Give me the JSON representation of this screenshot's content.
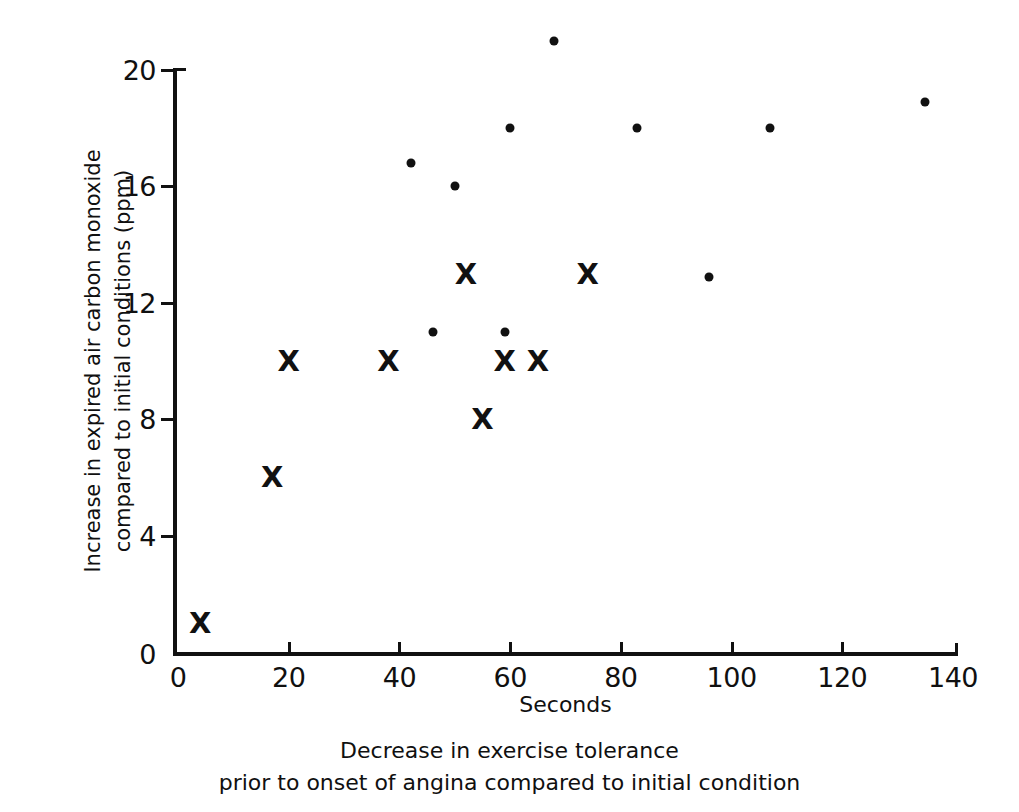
{
  "chart_data": {
    "type": "scatter",
    "title": "",
    "xlabel": "Seconds",
    "ylabel": "Increase in expired air carbon monoxide compared to initial conditions (ppm)",
    "ylabel_lines": [
      "Increase in expired air carbon monoxide",
      "compared to initial conditions (ppm)"
    ],
    "caption_lines": [
      "Decrease in exercise tolerance",
      "prior to onset of angina compared to initial condition"
    ],
    "xlim": [
      0,
      140
    ],
    "ylim": [
      0,
      20
    ],
    "xticks": [
      0,
      20,
      40,
      60,
      80,
      100,
      120,
      140
    ],
    "yticks": [
      0,
      4,
      8,
      12,
      16,
      20
    ],
    "xtick_labels": [
      "0",
      "20",
      "40",
      "60",
      "80",
      "100",
      "120",
      "140"
    ],
    "ytick_labels": [
      "0",
      "4",
      "8",
      "12",
      "16",
      "20"
    ],
    "grid": false,
    "legend": "none",
    "marker_color": "#111111",
    "series": [
      {
        "name": "dot",
        "marker": "dot",
        "glyph": "",
        "points": [
          {
            "x": 68,
            "y": 21.0
          },
          {
            "x": 42,
            "y": 16.8
          },
          {
            "x": 50,
            "y": 16.0
          },
          {
            "x": 60,
            "y": 18.0
          },
          {
            "x": 83,
            "y": 18.0
          },
          {
            "x": 107,
            "y": 18.0
          },
          {
            "x": 135,
            "y": 18.9
          },
          {
            "x": 96,
            "y": 12.9
          },
          {
            "x": 46,
            "y": 11.0
          },
          {
            "x": 59,
            "y": 11.0
          }
        ]
      },
      {
        "name": "cross",
        "marker": "x",
        "glyph": "X",
        "points": [
          {
            "x": 4,
            "y": 1.0
          },
          {
            "x": 17,
            "y": 6.0
          },
          {
            "x": 20,
            "y": 10.0
          },
          {
            "x": 38,
            "y": 10.0
          },
          {
            "x": 52,
            "y": 13.0
          },
          {
            "x": 55,
            "y": 8.0
          },
          {
            "x": 59,
            "y": 10.0
          },
          {
            "x": 65,
            "y": 10.0
          },
          {
            "x": 74,
            "y": 13.0
          }
        ]
      }
    ]
  }
}
